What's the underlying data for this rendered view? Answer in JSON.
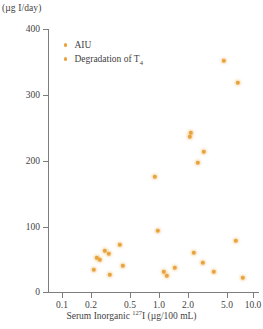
{
  "chart_data": {
    "type": "scatter",
    "title": "",
    "xlabel": "Serum Inorganic 127I (µg/100 mL)",
    "xlabel_prefix": "Serum Inorganic ",
    "xlabel_superscript": "127",
    "xlabel_suffix": "I (µg/100 mL)",
    "ylabel": "(µg I/day)",
    "xscale": "log",
    "yscale": "linear",
    "xlim": [
      0.08,
      13.0
    ],
    "ylim": [
      0,
      400
    ],
    "grid": false,
    "legend_position": "top-left-inside",
    "xticks": [
      {
        "value": 0.1,
        "label": "0.1",
        "px": 62
      },
      {
        "value": 0.2,
        "label": "0.2",
        "px": 91
      },
      {
        "value": 0.5,
        "label": "0.5",
        "px": 130
      },
      {
        "value": 1.0,
        "label": "1.0",
        "px": 159
      },
      {
        "value": 2.0,
        "label": "2.0",
        "px": 188
      },
      {
        "value": 5.0,
        "label": "5.0",
        "px": 227
      },
      {
        "value": 10.0,
        "label": "10.0",
        "px": 253
      }
    ],
    "yticks": [
      {
        "value": 400,
        "label": "400",
        "px": 29
      },
      {
        "value": 300,
        "label": "300",
        "px": 95
      },
      {
        "value": 200,
        "label": "200",
        "px": 161
      },
      {
        "value": 100,
        "label": "100",
        "px": 227
      },
      {
        "value": 0,
        "label": "0",
        "px": 292
      }
    ],
    "series": [
      {
        "name": "AIU",
        "marker": "circle",
        "color": "#E8A33D",
        "points": [
          {
            "x": 5.8,
            "y": 348,
            "px": 224,
            "py": 61
          },
          {
            "x": 8.3,
            "y": 315,
            "px": 238,
            "py": 83
          },
          {
            "x": 2.4,
            "y": 242,
            "px": 191,
            "py": 133
          },
          {
            "x": 2.3,
            "y": 229,
            "px": 190,
            "py": 137
          },
          {
            "x": 3.6,
            "y": 212,
            "px": 204,
            "py": 152
          },
          {
            "x": 3.1,
            "y": 196,
            "px": 198,
            "py": 163
          },
          {
            "x": 1.05,
            "y": 174,
            "px": 155,
            "py": 177
          },
          {
            "x": 1.05,
            "y": 93,
            "px": 158,
            "py": 231
          },
          {
            "x": 7.9,
            "y": 78,
            "px": 236,
            "py": 241
          },
          {
            "x": 0.41,
            "y": 71,
            "px": 120,
            "py": 245
          },
          {
            "x": 0.3,
            "y": 62,
            "px": 105,
            "py": 251
          },
          {
            "x": 0.33,
            "y": 57,
            "px": 109,
            "py": 254
          },
          {
            "x": 2.7,
            "y": 59,
            "px": 194,
            "py": 253
          },
          {
            "x": 0.24,
            "y": 52,
            "px": 97,
            "py": 258
          },
          {
            "x": 0.26,
            "y": 48,
            "px": 100,
            "py": 260
          },
          {
            "x": 3.5,
            "y": 44,
            "px": 203,
            "py": 263
          },
          {
            "x": 0.45,
            "y": 40,
            "px": 123,
            "py": 266
          },
          {
            "x": 1.6,
            "y": 36,
            "px": 175,
            "py": 268
          },
          {
            "x": 0.22,
            "y": 33,
            "px": 94,
            "py": 270
          },
          {
            "x": 1.25,
            "y": 30,
            "px": 164,
            "py": 272
          },
          {
            "x": 4.6,
            "y": 30,
            "px": 214,
            "py": 272
          },
          {
            "x": 0.34,
            "y": 26,
            "px": 110,
            "py": 275
          },
          {
            "x": 1.35,
            "y": 25,
            "px": 167,
            "py": 276
          },
          {
            "x": 9.6,
            "y": 22,
            "px": 243,
            "py": 278
          }
        ]
      },
      {
        "name": "Degradation of T4",
        "name_base": "Degradation of T",
        "name_subscript": "4",
        "marker": "circle",
        "color": "#E8A33D",
        "points": []
      }
    ]
  },
  "legend": {
    "items": [
      {
        "label": "AIU",
        "color": "#E8A33D"
      },
      {
        "label_base": "Degradation of T",
        "label_sub": "4",
        "color": "#E8A33D"
      }
    ]
  },
  "axes": {
    "y_unit_caption": "(µg I/day)"
  },
  "colors": {
    "marker": "#E8A33D",
    "axis": "#7d7d7d",
    "text": "#3f3f3f",
    "background": "#ffffff"
  }
}
